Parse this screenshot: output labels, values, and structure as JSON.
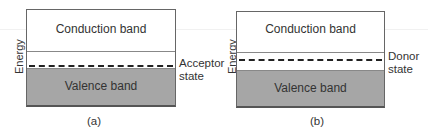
{
  "panels": [
    {
      "id": "a",
      "energy_label": "Energy",
      "conduction_label": "Conduction band",
      "valence_label": "Valence band",
      "state_label_line1": "Acceptor",
      "state_label_line2": "state",
      "caption": "(a)"
    },
    {
      "id": "b",
      "energy_label": "Energy",
      "conduction_label": "Conduction band",
      "valence_label": "Valence band",
      "state_label_line1": "Donor",
      "state_label_line2": "state",
      "caption": "(b)"
    }
  ],
  "colors": {
    "valence_fill": "#a6a6a6",
    "border": "#666666",
    "dash": "#222222"
  }
}
